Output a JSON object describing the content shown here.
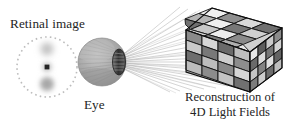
{
  "figure": {
    "background_color": "#ffffff",
    "width": 299,
    "height": 125
  },
  "labels": {
    "retinal_image": "Retinal image",
    "eye": "Eye",
    "reconstruction_line1": "Reconstruction of",
    "reconstruction_line2": "4D Light Fields"
  },
  "retinal_image_panel": {
    "shape": "dashed-circle",
    "center_x": 47,
    "center_y": 67,
    "radius": 30,
    "dash_color": "#b9b9b9",
    "dots": [
      {
        "name": "top-blurred-dot",
        "cx": 47,
        "cy": 49,
        "radius": 6.5,
        "blur": 3.0,
        "color": "#c2c2c2",
        "sharpness": "blurred"
      },
      {
        "name": "center-sharp-dot",
        "cx": 47,
        "cy": 67,
        "radius": 2.6,
        "blur": 0.5,
        "color": "#2b2b2b",
        "sharpness": "sharp"
      },
      {
        "name": "bottom-blurred-dot",
        "cx": 47,
        "cy": 84,
        "radius": 7.0,
        "blur": 2.6,
        "color": "#a8a8a8",
        "sharpness": "blurred"
      }
    ]
  },
  "eye_panel": {
    "center_x": 102,
    "center_y": 62,
    "radius": 24,
    "globe_color": "#a9a9a9",
    "lens_color": "#3a3a3a",
    "lens_cx": 119,
    "lens_cy": 62,
    "lens_rx": 6.5,
    "lens_ry": 13
  },
  "light_rays": {
    "color": "#9a9a9a",
    "count": 22,
    "origin_x": 120,
    "origin_y": 62,
    "description": "fan of thin rays from eye lens to cube"
  },
  "cube": {
    "type": "4x4 rubiks-style cube",
    "grid": 4,
    "edge_color": "#111111",
    "faces": {
      "top": [
        [
          "#efefef",
          "#8f8f8f",
          "#d9d9d9",
          "#6f6f6f"
        ],
        [
          "#b5b5b5",
          "#efefef",
          "#777777",
          "#cfcfcf"
        ],
        [
          "#6f6f6f",
          "#c7c7c7",
          "#ededed",
          "#8a8a8a"
        ],
        [
          "#d4d4d4",
          "#7d7d7d",
          "#b0b0b0",
          "#e8e8e8"
        ]
      ],
      "left": [
        [
          "#8a8a8a",
          "#d6d6d6",
          "#6a6a6a",
          "#bdbdbd"
        ],
        [
          "#c9c9c9",
          "#787878",
          "#cfcfcf",
          "#8d8d8d"
        ],
        [
          "#6e6e6e",
          "#bdbdbd",
          "#898989",
          "#d6d6d6"
        ],
        [
          "#bcbcbc",
          "#8c8c8c",
          "#c4c4c4",
          "#6f6f6f"
        ]
      ],
      "right": [
        [
          "#e7e7e7",
          "#5d5d5d",
          "#cacaca",
          "#8b8b8b"
        ],
        [
          "#6a6a6a",
          "#dcdcdc",
          "#767676",
          "#d2d2d2"
        ],
        [
          "#c5c5c5",
          "#828282",
          "#e0e0e0",
          "#646464"
        ],
        [
          "#7c7c7c",
          "#cdcdcd",
          "#6c6c6c",
          "#bdbdbd"
        ]
      ]
    }
  }
}
